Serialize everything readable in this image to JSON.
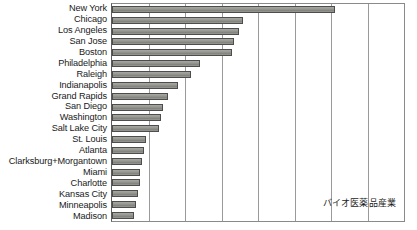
{
  "chart_data": {
    "type": "bar",
    "orientation": "horizontal",
    "title": "",
    "subtitle": "",
    "xlabel": "",
    "ylabel": "",
    "xlim": [
      0,
      8
    ],
    "grid": true,
    "gridlines_count": 7,
    "legend_position": "none",
    "annotations": [
      {
        "text": "バイオ医薬品産業",
        "x_frac": 0.72,
        "y_frac": 0.895
      }
    ],
    "categories": [
      "New York",
      "Chicago",
      "Los Angeles",
      "San Jose",
      "Boston",
      "Philadelphia",
      "Raleigh",
      "Indianapolis",
      "Grand Rapids",
      "San Diego",
      "Washington",
      "Salt Lake City",
      "St. Louis",
      "Atlanta",
      "Clarksburg+Morgantown",
      "Miami",
      "Charlotte",
      "Kansas City",
      "Minneapolis",
      "Madison"
    ],
    "values": [
      6.12,
      3.59,
      3.47,
      3.35,
      3.29,
      2.41,
      2.17,
      1.82,
      1.53,
      1.41,
      1.35,
      1.29,
      0.94,
      0.88,
      0.82,
      0.76,
      0.76,
      0.71,
      0.65,
      0.59
    ],
    "bar_color": "#8c8c86",
    "bar_edge_color": "#4d4d4d",
    "gridline_color": "#9a9a9a",
    "axis_color": "#5c5c5c",
    "background_color": "#ffffff"
  }
}
